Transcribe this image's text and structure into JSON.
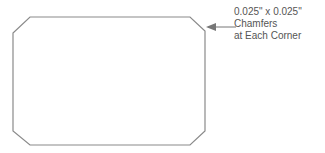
{
  "diagram": {
    "shape": "rectangle-with-chamfered-corners",
    "stroke_color": "#8a8a8a",
    "callout": {
      "lines": [
        "0.025\" x 0.025\"",
        "Chamfers",
        "at Each Corner"
      ],
      "arrow": "left-pointing-arrow"
    }
  }
}
